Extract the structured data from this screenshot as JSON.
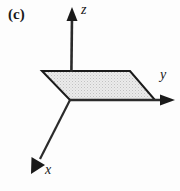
{
  "figure": {
    "panel_label": "(c)",
    "background_color": "#fdfdfd",
    "stroke_color": "#1a1a1a",
    "plane_fill_color": "#e0e0e0"
  },
  "axes": [
    {
      "name": "z",
      "label": "z",
      "direction": "up",
      "origin": [
        70,
        100
      ],
      "tip": [
        72,
        9
      ],
      "arrowhead": true
    },
    {
      "name": "y",
      "label": "y",
      "direction": "right",
      "origin": [
        70,
        100
      ],
      "tip": [
        174,
        100
      ],
      "arrowhead": true
    },
    {
      "name": "x",
      "label": "x",
      "direction": "down-left",
      "origin": [
        70,
        100
      ],
      "tip": [
        32,
        173
      ],
      "arrowhead": true
    }
  ],
  "plane": {
    "name": "xy-plane",
    "shape": "parallelogram",
    "vertices": [
      [
        42,
        71
      ],
      [
        130,
        71
      ],
      [
        155,
        100
      ],
      [
        70,
        100
      ]
    ],
    "fill": "stippled-gray",
    "outline_width": 2
  }
}
